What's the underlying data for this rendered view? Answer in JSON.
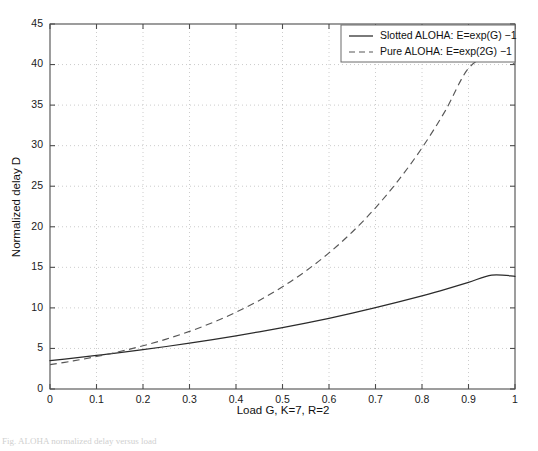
{
  "figure": {
    "background_color": "#ffffff",
    "caption_fragment": "Fig. ALOHA normalized delay versus load"
  },
  "chart_data": {
    "type": "line",
    "title": "",
    "xlabel": "Load G,  K=7, R=2",
    "ylabel": "Normalized delay D",
    "xlim": [
      0,
      1
    ],
    "ylim": [
      0,
      45
    ],
    "xticks": [
      "0",
      "0.1",
      "0.2",
      "0.3",
      "0.4",
      "0.5",
      "0.6",
      "0.7",
      "0.8",
      "0.9",
      "1"
    ],
    "xtick_values": [
      0,
      0.1,
      0.2,
      0.3,
      0.4,
      0.5,
      0.6,
      0.7,
      0.8,
      0.9,
      1
    ],
    "yticks": [
      "0",
      "5",
      "10",
      "15",
      "20",
      "25",
      "30",
      "35",
      "40",
      "45"
    ],
    "ytick_values": [
      0,
      5,
      10,
      15,
      20,
      25,
      30,
      35,
      40,
      45
    ],
    "grid": true,
    "grid_style": "dotted",
    "legend_position": "top-right",
    "x": [
      0,
      0.05,
      0.1,
      0.15,
      0.2,
      0.25,
      0.3,
      0.35,
      0.4,
      0.45,
      0.5,
      0.55,
      0.6,
      0.65,
      0.7,
      0.75,
      0.8,
      0.85,
      0.9,
      0.95,
      1
    ],
    "series": [
      {
        "name": "Slotted ALOHA: E=exp(G) −1",
        "style": "solid",
        "color": "#2b2b2b",
        "values": [
          3.5,
          3.81,
          4.14,
          4.48,
          4.85,
          5.24,
          5.65,
          6.09,
          6.55,
          7.05,
          7.57,
          8.13,
          8.72,
          9.35,
          10.02,
          10.73,
          11.49,
          12.29,
          13.14,
          14.05,
          13.9
        ]
      },
      {
        "name": "Pure ALOHA: E=exp(2G) −1",
        "style": "dashed",
        "color": "#575757",
        "values": [
          3.0,
          3.46,
          4.0,
          4.62,
          5.33,
          6.15,
          7.1,
          8.2,
          9.46,
          10.92,
          12.6,
          14.54,
          16.78,
          19.36,
          22.34,
          25.78,
          29.73,
          34.29,
          39.53,
          41.0,
          40.0
        ]
      }
    ],
    "annotations": []
  },
  "legend": {
    "entries": [
      {
        "label": "Slotted ALOHA: E=exp(G) −1",
        "style": "solid"
      },
      {
        "label": "Pure ALOHA: E=exp(2G) −1",
        "style": "dashed"
      }
    ]
  }
}
